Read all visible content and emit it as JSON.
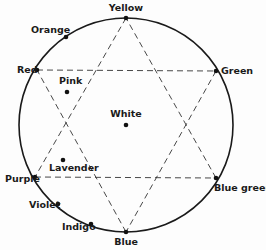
{
  "diagram": {
    "type": "color-wheel-hexagram",
    "circle": {
      "cx": 126,
      "cy": 125,
      "r": 107
    },
    "points": [
      {
        "id": "yellow",
        "label": "Yellow",
        "x": 126,
        "y": 18,
        "lx": 126,
        "ly": 11,
        "anchor": "middle"
      },
      {
        "id": "orange",
        "label": "Orange",
        "x": 66,
        "y": 37,
        "lx": 31,
        "ly": 33,
        "anchor": "start"
      },
      {
        "id": "red",
        "label": "Red",
        "x": 37,
        "y": 70,
        "lx": 17,
        "ly": 73,
        "anchor": "start"
      },
      {
        "id": "green",
        "label": "Green",
        "x": 216,
        "y": 71,
        "lx": 221,
        "ly": 74,
        "anchor": "start"
      },
      {
        "id": "purple",
        "label": "Purple",
        "x": 35,
        "y": 177,
        "lx": 5,
        "ly": 182,
        "anchor": "start"
      },
      {
        "id": "violet",
        "label": "Violet",
        "x": 58,
        "y": 204,
        "lx": 29,
        "ly": 208,
        "anchor": "start"
      },
      {
        "id": "indigo",
        "label": "Indigo",
        "x": 91,
        "y": 224,
        "lx": 62,
        "ly": 230,
        "anchor": "start"
      },
      {
        "id": "blue",
        "label": "Blue",
        "x": 126,
        "y": 232,
        "lx": 126,
        "ly": 245,
        "anchor": "middle"
      },
      {
        "id": "blue-green",
        "label": "Blue green",
        "x": 216,
        "y": 178,
        "lx": 214,
        "ly": 191,
        "anchor": "start"
      }
    ],
    "interior_points": [
      {
        "id": "pink",
        "label": "Pink",
        "x": 67,
        "y": 92,
        "lx": 59,
        "ly": 84,
        "anchor": "start"
      },
      {
        "id": "white",
        "label": "White",
        "x": 126,
        "y": 125,
        "lx": 126,
        "ly": 117,
        "anchor": "middle"
      },
      {
        "id": "lavender",
        "label": "Lavender",
        "x": 63,
        "y": 160,
        "lx": 49,
        "ly": 171,
        "anchor": "start"
      }
    ],
    "triangles": [
      [
        "yellow",
        "purple",
        "blue-green"
      ],
      [
        "blue",
        "red",
        "green"
      ]
    ]
  }
}
